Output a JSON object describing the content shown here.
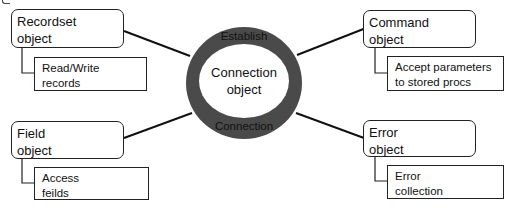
{
  "center": {
    "top_label": "Establish",
    "title_line1": "Connection",
    "title_line2": "object",
    "bottom_label": "Connection",
    "ring_color": "#4a4a4a"
  },
  "objects": [
    {
      "id": "recordset",
      "line1": "Recordset",
      "line2": "object",
      "sub_line1": "Read/Write",
      "sub_line2": "records"
    },
    {
      "id": "command",
      "line1": "Command",
      "line2": "object",
      "sub_line1": "Accept parameters",
      "sub_line2": "to stored procs"
    },
    {
      "id": "field",
      "line1": "Field",
      "line2": "object",
      "sub_line1": "Access",
      "sub_line2": "feilds"
    },
    {
      "id": "error",
      "line1": "Error",
      "line2": "object",
      "sub_line1": "Error",
      "sub_line2": "collection"
    }
  ]
}
